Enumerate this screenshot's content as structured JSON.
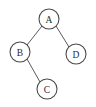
{
  "diagram": {
    "type": "tree",
    "background_color": "#ffffff",
    "node_fill_color": "#ffffff",
    "node_stroke_color": "#4a4a4a",
    "edge_color": "#5a5a5a",
    "label_color": "#2b2b2b",
    "node_radius": 10,
    "nodes": [
      {
        "id": "A",
        "label": "A",
        "cx": 49,
        "cy": 19,
        "r": 10,
        "role": "root"
      },
      {
        "id": "B",
        "label": "B",
        "cx": 20,
        "cy": 52,
        "r": 10,
        "role": "left-child-of-A"
      },
      {
        "id": "D",
        "label": "D",
        "cx": 76,
        "cy": 54,
        "r": 10,
        "role": "right-child-of-A"
      },
      {
        "id": "C",
        "label": "C",
        "cx": 47,
        "cy": 89,
        "r": 10,
        "role": "right-child-of-B"
      }
    ],
    "edges": [
      {
        "id": "A-B",
        "from": "A",
        "to": "B",
        "x1": 42,
        "y1": 26,
        "x2": 27,
        "y2": 45
      },
      {
        "id": "A-D",
        "from": "A",
        "to": "D",
        "x1": 56,
        "y1": 26,
        "x2": 69,
        "y2": 47
      },
      {
        "id": "B-C",
        "from": "B",
        "to": "C",
        "x1": 27,
        "y1": 59,
        "x2": 40,
        "y2": 82
      }
    ]
  }
}
